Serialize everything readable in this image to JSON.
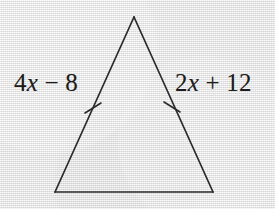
{
  "figure": {
    "kind": "isosceles-triangle-diagram",
    "background_color": "#e9e9e9",
    "stroke_color": "#2a2a2a",
    "text_color": "#1d1d1d",
    "canvas": {
      "width": 275,
      "height": 209
    },
    "vertices": {
      "apex": {
        "x": 134,
        "y": 17
      },
      "bottom_left": {
        "x": 55,
        "y": 192
      },
      "bottom_right": {
        "x": 213,
        "y": 192
      }
    },
    "congruence_ticks": [
      {
        "id": "left-leg-tick",
        "x": 93,
        "y": 108,
        "count": 1
      },
      {
        "id": "right-leg-tick",
        "x": 172,
        "y": 107,
        "count": 1
      }
    ],
    "labels": {
      "left_leg": {
        "full_text": "4x − 8",
        "coefficient": "4",
        "variable": "x",
        "operator": "−",
        "constant": "8"
      },
      "right_leg": {
        "full_text": "2x + 12",
        "coefficient": "2",
        "variable": "x",
        "operator": "+",
        "constant": "12"
      }
    }
  }
}
